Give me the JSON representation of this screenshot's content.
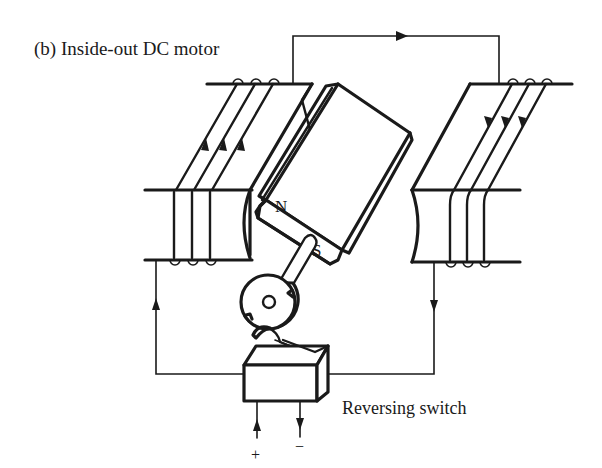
{
  "diagram": {
    "title": "(b) Inside-out DC motor",
    "components": {
      "rotor_magnet": {
        "north_label": "N",
        "south_label": "S"
      },
      "left_stator_coil": {
        "current_direction": "up"
      },
      "right_stator_coil": {
        "current_direction": "down"
      },
      "top_connection": {
        "current_direction": "right"
      },
      "commutator": {
        "type": "disc with contact brush"
      },
      "switch": {
        "label": "Reversing switch",
        "plus_terminal": "+",
        "minus_terminal": "−"
      }
    },
    "colors": {
      "ink": "#1a1a1a",
      "background": "#ffffff"
    }
  }
}
